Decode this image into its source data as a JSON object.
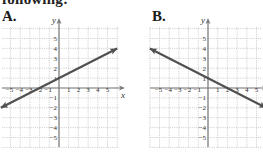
{
  "header": {
    "text": "following:"
  },
  "colors": {
    "line": "#505050",
    "axis": "#7a7a7a",
    "grid": "#c8c8c8",
    "text": "#333333"
  },
  "chart_data": [
    {
      "type": "line",
      "label": "A.",
      "title": "",
      "xlabel": "x",
      "ylabel": "y",
      "xlim": [
        -6,
        6
      ],
      "ylim": [
        -6,
        6
      ],
      "grid": true,
      "x_ticks": [
        "−5",
        "−4",
        "−3",
        "−2",
        "−1",
        "1",
        "2",
        "3",
        "4",
        "5"
      ],
      "y_ticks": [
        "5",
        "4",
        "3",
        "2",
        "1",
        "−1",
        "−2",
        "−3",
        "−4",
        "−5"
      ],
      "series": [
        {
          "name": "line A",
          "x": [
            -6,
            6
          ],
          "y": [
            -2,
            4
          ],
          "arrows": "both",
          "equation": "y = 0.5x + 1"
        }
      ]
    },
    {
      "type": "line",
      "label": "B.",
      "title": "",
      "xlabel": "x",
      "ylabel": "y",
      "xlim": [
        -6,
        6
      ],
      "ylim": [
        -6,
        6
      ],
      "grid": true,
      "x_ticks": [
        "−5",
        "−4",
        "−3",
        "−2",
        "−1",
        "1",
        "2",
        "3",
        "4",
        "5"
      ],
      "y_ticks": [
        "5",
        "4",
        "3",
        "2",
        "1",
        "−1",
        "−2",
        "−3",
        "−4",
        "−5"
      ],
      "series": [
        {
          "name": "line B",
          "x": [
            -6,
            6
          ],
          "y": [
            4,
            -2
          ],
          "arrows": "both",
          "equation": "y = -0.5x + 1"
        }
      ]
    }
  ]
}
